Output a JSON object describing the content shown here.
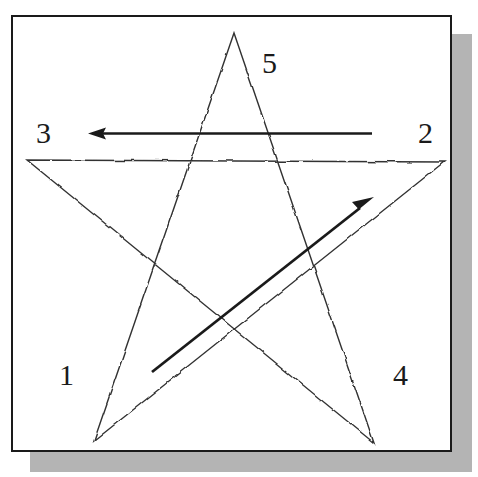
{
  "figure": {
    "frame": {
      "border_color": "#1a1a1a",
      "background_color": "#ffffff",
      "shadow_color": "#b4b4b4"
    },
    "labels": [
      {
        "id": "label-1",
        "text": "1",
        "x": 59,
        "y": 360,
        "corner": "bottom-left"
      },
      {
        "id": "label-2",
        "text": "2",
        "x": 418,
        "y": 118,
        "corner": "upper-right"
      },
      {
        "id": "label-3",
        "text": "3",
        "x": 36,
        "y": 118,
        "corner": "upper-left"
      },
      {
        "id": "label-4",
        "text": "4",
        "x": 393,
        "y": 360,
        "corner": "bottom-right"
      },
      {
        "id": "label-5",
        "text": "5",
        "x": 262,
        "y": 48,
        "corner": "top"
      }
    ],
    "star": {
      "stroke_color": "#333333",
      "stroke_width": 1.3,
      "style": "hand-drawn wavy thin line",
      "vertices": [
        {
          "name": "bottom-left",
          "x": 94,
          "y": 441
        },
        {
          "name": "upper-right",
          "x": 444,
          "y": 162
        },
        {
          "name": "upper-left",
          "x": 27,
          "y": 160
        },
        {
          "name": "bottom-right",
          "x": 374,
          "y": 443
        },
        {
          "name": "top",
          "x": 234,
          "y": 33
        }
      ],
      "path_order": [
        "bottom-left",
        "upper-right",
        "upper-left",
        "bottom-right",
        "top",
        "bottom-left"
      ]
    },
    "arrows": [
      {
        "id": "horizontal-arrow",
        "direction": "right-to-left",
        "from": {
          "x": 372,
          "y": 133
        },
        "to": {
          "x": 88,
          "y": 133
        },
        "color": "#1a1a1a",
        "stroke_width": 3,
        "describes": "direction of stroke from vertex 2 to vertex 3"
      },
      {
        "id": "diagonal-arrow",
        "direction": "lower-left-to-upper-right",
        "from": {
          "x": 152,
          "y": 372
        },
        "to": {
          "x": 374,
          "y": 197
        },
        "color": "#1a1a1a",
        "stroke_width": 3,
        "describes": "direction of stroke from vertex 1 to vertex 2"
      }
    ]
  }
}
